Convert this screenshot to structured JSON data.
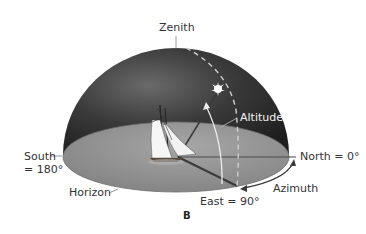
{
  "figure": {
    "caption": "B",
    "labels": {
      "zenith": "Zenith",
      "altitude": "Altitude",
      "north": "North = 0°",
      "south_line1": "South",
      "south_line2": "= 180°",
      "horizon": "Horizon",
      "east": "East = 90°",
      "azimuth": "Azimuth"
    },
    "colors": {
      "dome_dark": "#2a2a2a",
      "dome_light": "#5a5a5a",
      "horizon_plane": "#8c8c8c",
      "horizon_plane_light": "#a8a8a8",
      "lines": "#555555",
      "arc": "#e8e8e8",
      "star": "#ffffff"
    }
  }
}
